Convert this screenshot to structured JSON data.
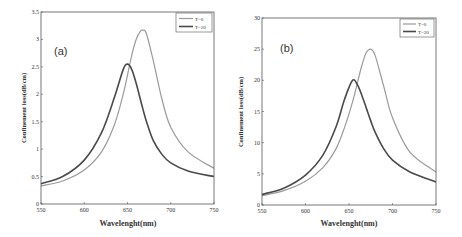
{
  "colors": {
    "t0": "#9a9a9a",
    "t20": "#4a4a4a",
    "axis": "#555555"
  },
  "chart_data": [
    {
      "type": "line",
      "panel_label": "(a)",
      "title": "",
      "xlabel": "Wavelenght(nm)",
      "ylabel": "Confinement loss(dB/cm)",
      "xlim": [
        550,
        750
      ],
      "ylim": [
        0,
        3.5
      ],
      "xticks": [
        550,
        600,
        650,
        700,
        750
      ],
      "yticks": [
        0,
        0.5,
        1,
        1.5,
        2,
        2.5,
        3,
        3.5
      ],
      "ytick_labels": [
        "0",
        "0.5",
        "1",
        "1.5",
        "2",
        "2.5",
        "3",
        "3.5"
      ],
      "grid": false,
      "legend_position": "upper right",
      "x": [
        550,
        575,
        600,
        620,
        635,
        645,
        650,
        655,
        660,
        665,
        668,
        672,
        680,
        690,
        700,
        720,
        750
      ],
      "series": [
        {
          "name": "T=0",
          "values": [
            0.33,
            0.42,
            0.62,
            0.95,
            1.45,
            2.0,
            2.35,
            2.72,
            3.0,
            3.15,
            3.17,
            3.1,
            2.6,
            1.9,
            1.4,
            0.95,
            0.65
          ]
        },
        {
          "name": "T=20",
          "values": [
            0.37,
            0.5,
            0.8,
            1.3,
            1.95,
            2.45,
            2.55,
            2.45,
            2.2,
            1.9,
            1.72,
            1.5,
            1.15,
            0.9,
            0.75,
            0.6,
            0.5
          ]
        }
      ]
    },
    {
      "type": "line",
      "panel_label": "(b)",
      "title": "",
      "xlabel": "Wavelenght(nm)",
      "ylabel": "Confinement loss(dB/cm)",
      "xlim": [
        550,
        750
      ],
      "ylim": [
        0,
        30
      ],
      "xticks": [
        550,
        600,
        650,
        700,
        750
      ],
      "yticks": [
        0,
        5,
        10,
        15,
        20,
        25,
        30
      ],
      "ytick_labels": [
        "0",
        "5",
        "10",
        "15",
        "20",
        "25",
        "30"
      ],
      "grid": false,
      "legend_position": "upper right",
      "x": [
        550,
        575,
        600,
        620,
        635,
        645,
        654,
        660,
        665,
        670,
        675,
        680,
        690,
        700,
        720,
        750
      ],
      "series": [
        {
          "name": "T=0",
          "values": [
            1.5,
            2.3,
            3.8,
            6.0,
            9.0,
            12.5,
            16.5,
            19.8,
            22.5,
            24.5,
            25.0,
            24.0,
            19.0,
            14.0,
            8.5,
            5.3
          ]
        },
        {
          "name": "T=20",
          "values": [
            1.7,
            2.7,
            4.8,
            8.0,
            12.5,
            17.0,
            20.0,
            19.2,
            17.5,
            15.5,
            13.5,
            11.7,
            9.0,
            7.2,
            5.3,
            3.7
          ]
        }
      ]
    }
  ]
}
